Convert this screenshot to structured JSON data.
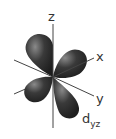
{
  "diagram": {
    "orbital_label": "d",
    "orbital_subscript": "yz",
    "axes": [
      {
        "name": "z",
        "label": "z"
      },
      {
        "name": "x",
        "label": "x"
      },
      {
        "name": "y",
        "label": "y"
      }
    ],
    "colors": {
      "lobe": "#2e2e2e",
      "lobe_highlight": "#8a8a8a",
      "axis": "#444444",
      "text": "#333333"
    }
  }
}
